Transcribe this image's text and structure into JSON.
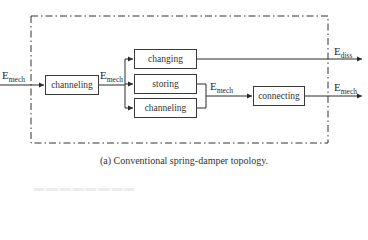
{
  "diagram": {
    "boundary": {
      "style": "dash-dot"
    },
    "input": {
      "label_main": "E",
      "label_sub": "mech"
    },
    "blocks": {
      "channeling_main": "channeling",
      "changing": "changing",
      "storing": "storing",
      "channeling_branch": "channeling",
      "connecting": "connecting"
    },
    "edges": {
      "after_channeling": {
        "label_main": "E",
        "label_sub": "mech"
      },
      "after_merge": {
        "label_main": "E",
        "label_sub": "mech"
      },
      "output_diss": {
        "label_main": "E",
        "label_sub": "diss"
      },
      "output_mech": {
        "label_main": "E",
        "label_sub": "mech"
      }
    },
    "caption": "(a) Conventional spring-damper topology."
  }
}
